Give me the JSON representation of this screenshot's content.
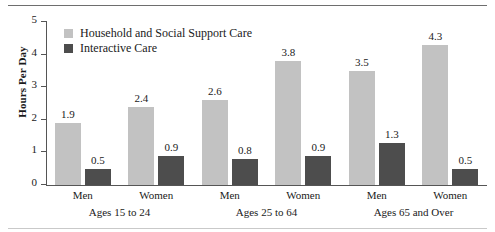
{
  "chart_data": {
    "type": "bar",
    "title": "",
    "xlabel": "",
    "ylabel": "Hours Per Day",
    "ylim": [
      0,
      5
    ],
    "yticks": [
      "0",
      "1",
      "2",
      "3",
      "4",
      "5"
    ],
    "grid": false,
    "legend_position": "top-left",
    "categories": [
      "Men",
      "Women",
      "Men",
      "Women",
      "Men",
      "Women"
    ],
    "groups": [
      {
        "label": "Ages 15 to 24",
        "categories": [
          "Men",
          "Women"
        ]
      },
      {
        "label": "Ages 25 to 64",
        "categories": [
          "Men",
          "Women"
        ]
      },
      {
        "label": "Ages 65 and Over",
        "categories": [
          "Men",
          "Women"
        ]
      }
    ],
    "series": [
      {
        "name": "Household and Social Support Care",
        "color": "#c2c2c2",
        "values": [
          1.9,
          2.4,
          2.6,
          3.8,
          3.5,
          4.3
        ],
        "labels": [
          "1.9",
          "2.4",
          "2.6",
          "3.8",
          "3.5",
          "4.3"
        ]
      },
      {
        "name": "Interactive Care",
        "color": "#4d4d4d",
        "values": [
          0.5,
          0.9,
          0.8,
          0.9,
          1.3,
          0.5
        ],
        "labels": [
          "0.5",
          "0.9",
          "0.8",
          "0.9",
          "1.3",
          "0.5"
        ]
      }
    ]
  }
}
